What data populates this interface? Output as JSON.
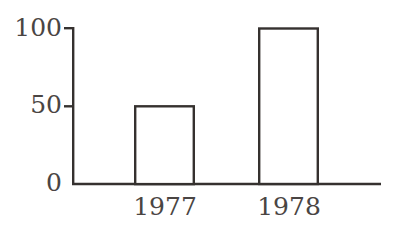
{
  "chart_data": {
    "type": "bar",
    "title": "",
    "subtitle": "",
    "xlabel": "",
    "ylabel": "",
    "categories": [
      "1977",
      "1978"
    ],
    "values": [
      50,
      100
    ],
    "series": [
      {
        "name": "",
        "values": [
          50,
          100
        ]
      }
    ],
    "ylim": [
      0,
      100
    ],
    "yticks": [
      0,
      50,
      100
    ],
    "ytick_labels": [
      "0",
      "50",
      "100"
    ],
    "grid": false,
    "legend": false,
    "legend_position": "none",
    "annotations": []
  },
  "style": {
    "background_color": "#ffffff",
    "line_color": "#35312f",
    "text_color": "#4a4543",
    "bar_fill_color": "#ffffff",
    "bar_stroke_color": "#35312f"
  },
  "axes": {
    "y_tick_0": "0",
    "y_tick_50": "50",
    "y_tick_100": "100",
    "x_tick_1": "1977",
    "x_tick_2": "1978"
  }
}
